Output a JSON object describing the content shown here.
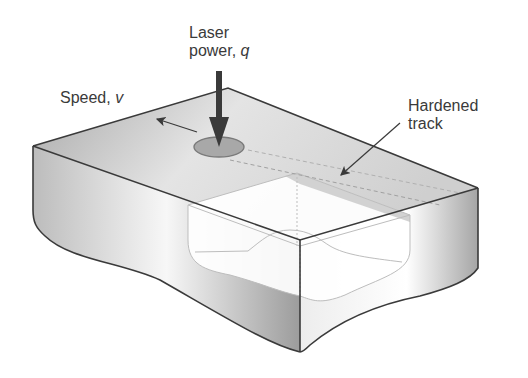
{
  "figure": {
    "type": "laser surface hardening schematic",
    "labels": {
      "laser_line1": "Laser",
      "laser_line2": "power, ",
      "laser_symbol": "q",
      "speed_text": "Speed, ",
      "speed_symbol": "v",
      "hardened_line1": "Hardened",
      "hardened_line2": "track"
    },
    "colors": {
      "outline": "#3a3a3a",
      "spot_fill": "#a8a8a8",
      "shade_dark": "#9c9c9c",
      "shade_light": "#ffffff",
      "cutaway_line": "#bdbdbd"
    }
  }
}
